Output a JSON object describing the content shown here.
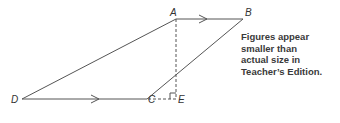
{
  "figure": {
    "type": "trapezoid",
    "points": {
      "A": {
        "label": "A",
        "x": 176,
        "y": 19
      },
      "B": {
        "label": "B",
        "x": 243,
        "y": 19
      },
      "C": {
        "label": "C",
        "x": 147,
        "y": 99
      },
      "D": {
        "label": "D",
        "x": 22,
        "y": 99
      },
      "E": {
        "label": "E",
        "x": 176,
        "y": 99
      }
    },
    "segments": [
      {
        "from": "A",
        "to": "B",
        "style": "solid",
        "parallel_mark": true
      },
      {
        "from": "D",
        "to": "C",
        "style": "solid",
        "parallel_mark": true
      },
      {
        "from": "A",
        "to": "D",
        "style": "solid"
      },
      {
        "from": "B",
        "to": "C",
        "style": "solid"
      },
      {
        "from": "A",
        "to": "E",
        "style": "dashed"
      },
      {
        "from": "C",
        "to": "E",
        "style": "dashed"
      }
    ],
    "right_angle_at": "E",
    "line_color": "#555555"
  },
  "note": {
    "lines": [
      "Figures appear",
      "smaller than",
      "actual size in",
      "Teacher’s Edition."
    ]
  }
}
